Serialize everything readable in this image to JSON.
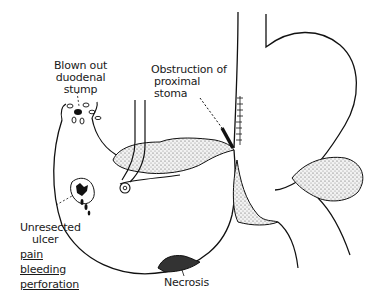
{
  "diagram": {
    "type": "anatomical illustration",
    "colors": {
      "line": "#111111",
      "stipple": "#bdbdbd",
      "background": "#ffffff"
    }
  },
  "labels": {
    "duodenal_stump": {
      "line1": "Blown out",
      "line2": "duodenal",
      "line3": "stump"
    },
    "obstruction": {
      "line1": "Obstruction of",
      "line2": "proximal",
      "line3": "stoma"
    },
    "ulcer": {
      "line1": "Unresected",
      "line2": "ulcer",
      "symptoms": [
        "pain",
        "bleeding",
        "perforation"
      ]
    },
    "necrosis": {
      "line1": "Necrosis"
    }
  }
}
